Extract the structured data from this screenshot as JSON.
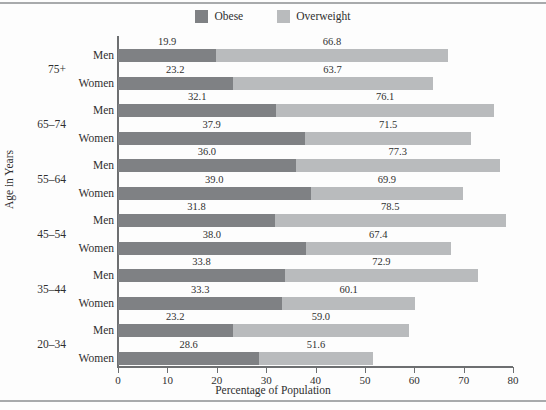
{
  "figure": {
    "background": "#fdfdfd",
    "rule_color": "#a8aaac"
  },
  "legend": {
    "position": "top-center",
    "items": [
      {
        "label": "Obese",
        "color": "#7f8184",
        "icon": "legend-swatch-icon"
      },
      {
        "label": "Overweight",
        "color": "#b9bbbd",
        "icon": "legend-swatch-icon"
      }
    ]
  },
  "axes": {
    "x_title": "Percentage of Population",
    "y_title": "Age in Years",
    "x_ticks": [
      "0",
      "10",
      "20",
      "30",
      "40",
      "50",
      "60",
      "70",
      "80"
    ],
    "x_tick_values": [
      0,
      10,
      20,
      30,
      40,
      50,
      60,
      70,
      80
    ],
    "xlim": [
      0,
      80
    ]
  },
  "chart_data": {
    "type": "bar",
    "orientation": "horizontal",
    "stacked": true,
    "title": "",
    "subtitle": "",
    "xlabel": "Percentage of Population",
    "ylabel": "Age in Years",
    "xlim": [
      0,
      80
    ],
    "grid": false,
    "legend_position": "top-center",
    "note": "Each bar is cumulative: the 'Overweight' label is the total percentage overweight-or-obese; the 'Obese' label is the dark segment.",
    "categories": [
      "75+ Men",
      "75+ Women",
      "65–74 Men",
      "65–74 Women",
      "55–64 Men",
      "55–64 Women",
      "45–54 Men",
      "45–54 Women",
      "35–44 Men",
      "35–44 Women",
      "20–34 Men",
      "20–34 Women"
    ],
    "series": [
      {
        "name": "Obese",
        "color": "#7f8184",
        "values": [
          19.9,
          23.2,
          32.1,
          37.9,
          36.0,
          39.0,
          31.8,
          38.0,
          33.8,
          33.3,
          23.2,
          28.6
        ]
      },
      {
        "name": "Overweight",
        "color": "#b9bbbd",
        "values": [
          66.8,
          63.7,
          76.1,
          71.5,
          77.3,
          69.9,
          78.5,
          67.4,
          72.9,
          60.1,
          59.0,
          51.6
        ]
      }
    ],
    "age_groups": [
      "75+",
      "65–74",
      "55–64",
      "45–54",
      "35–44",
      "20–34"
    ],
    "rows": [
      {
        "age": "75+",
        "sex": "Men",
        "obese": "19.9",
        "overweight": "66.8",
        "obese_value": 19.9,
        "overweight_value": 66.8
      },
      {
        "age": "75+",
        "sex": "Women",
        "obese": "23.2",
        "overweight": "63.7",
        "obese_value": 23.2,
        "overweight_value": 63.7
      },
      {
        "age": "65–74",
        "sex": "Men",
        "obese": "32.1",
        "overweight": "76.1",
        "obese_value": 32.1,
        "overweight_value": 76.1
      },
      {
        "age": "65–74",
        "sex": "Women",
        "obese": "37.9",
        "overweight": "71.5",
        "obese_value": 37.9,
        "overweight_value": 71.5
      },
      {
        "age": "55–64",
        "sex": "Men",
        "obese": "36.0",
        "overweight": "77.3",
        "obese_value": 36.0,
        "overweight_value": 77.3
      },
      {
        "age": "55–64",
        "sex": "Women",
        "obese": "39.0",
        "overweight": "69.9",
        "obese_value": 39.0,
        "overweight_value": 69.9
      },
      {
        "age": "45–54",
        "sex": "Men",
        "obese": "31.8",
        "overweight": "78.5",
        "obese_value": 31.8,
        "overweight_value": 78.5
      },
      {
        "age": "45–54",
        "sex": "Women",
        "obese": "38.0",
        "overweight": "67.4",
        "obese_value": 38.0,
        "overweight_value": 67.4
      },
      {
        "age": "35–44",
        "sex": "Men",
        "obese": "33.8",
        "overweight": "72.9",
        "obese_value": 33.8,
        "overweight_value": 72.9
      },
      {
        "age": "35–44",
        "sex": "Women",
        "obese": "33.3",
        "overweight": "60.1",
        "obese_value": 33.3,
        "overweight_value": 60.1
      },
      {
        "age": "20–34",
        "sex": "Men",
        "obese": "23.2",
        "overweight": "59.0",
        "obese_value": 23.2,
        "overweight_value": 59.0
      },
      {
        "age": "20–34",
        "sex": "Women",
        "obese": "28.6",
        "overweight": "51.6",
        "obese_value": 28.6,
        "overweight_value": 51.6
      }
    ]
  }
}
